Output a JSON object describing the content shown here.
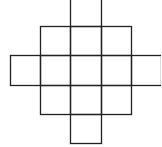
{
  "diagram": {
    "type": "grid-cross-shape",
    "stroke_color": "#222222",
    "background": "#ffffff",
    "cell_size": 30,
    "rows": [
      {
        "row": 0,
        "cols": [
          2
        ]
      },
      {
        "row": 1,
        "cols": [
          1,
          2,
          3
        ]
      },
      {
        "row": 2,
        "cols": [
          0,
          1,
          2,
          3,
          4
        ]
      },
      {
        "row": 3,
        "cols": [
          1,
          2,
          3
        ]
      },
      {
        "row": 4,
        "cols": [
          2
        ]
      }
    ],
    "cell_count": 13
  }
}
